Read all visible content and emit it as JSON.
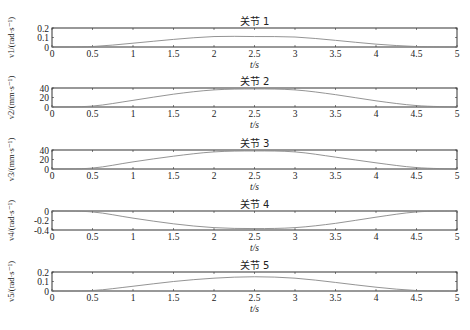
{
  "chart_data": [
    {
      "type": "line",
      "title": "关节 1",
      "xlabel": "t/s",
      "ylabel": "v1/(rad·s⁻¹)",
      "xlim": [
        0,
        5
      ],
      "ylim": [
        0,
        0.2
      ],
      "xticks": [
        "0",
        "0.5",
        "1",
        "1.5",
        "2",
        "2.5",
        "3",
        "3.5",
        "4",
        "4.5",
        "5"
      ],
      "yticks": [
        "0",
        "0.1",
        "0.2"
      ],
      "x": [
        0,
        0.5,
        1,
        1.5,
        2,
        2.5,
        3,
        3.5,
        4,
        4.5,
        5
      ],
      "values": [
        0,
        0.005,
        0.04,
        0.08,
        0.11,
        0.11,
        0.105,
        0.07,
        0.03,
        0.005,
        0
      ]
    },
    {
      "type": "line",
      "title": "关节 2",
      "xlabel": "t/s",
      "ylabel": "v2/(mm·s⁻¹)",
      "xlim": [
        0,
        5
      ],
      "ylim": [
        0,
        40
      ],
      "xticks": [
        "0",
        "0.5",
        "1",
        "1.5",
        "2",
        "2.5",
        "3",
        "3.5",
        "4",
        "4.5",
        "5"
      ],
      "yticks": [
        "0",
        "20",
        "40"
      ],
      "x": [
        0,
        0.5,
        1,
        1.5,
        2,
        2.5,
        3,
        3.5,
        4,
        4.5,
        5
      ],
      "values": [
        0,
        2,
        14,
        27,
        36,
        38,
        36,
        26,
        13,
        3,
        0
      ]
    },
    {
      "type": "line",
      "title": "关节 3",
      "xlabel": "t/s",
      "ylabel": "v3/(mm·s⁻¹)",
      "xlim": [
        0,
        5
      ],
      "ylim": [
        0,
        40
      ],
      "xticks": [
        "0",
        "0.5",
        "1",
        "1.5",
        "2",
        "2.5",
        "3",
        "3.5",
        "4",
        "4.5",
        "5"
      ],
      "yticks": [
        "0",
        "20",
        "40"
      ],
      "x": [
        0,
        0.5,
        1,
        1.5,
        2,
        2.5,
        3,
        3.5,
        4,
        4.5,
        5
      ],
      "values": [
        0,
        2,
        15,
        27,
        36,
        38,
        36,
        25,
        13,
        3,
        0
      ]
    },
    {
      "type": "line",
      "title": "关节 4",
      "xlabel": "t/s",
      "ylabel": "v4/(rad·s⁻¹)",
      "xlim": [
        0,
        5
      ],
      "ylim": [
        -0.4,
        0
      ],
      "xticks": [
        "0",
        "0.5",
        "1",
        "1.5",
        "2",
        "2.5",
        "3",
        "3.5",
        "4",
        "4.5",
        "5"
      ],
      "yticks": [
        "-0.4",
        "-0.2",
        "0"
      ],
      "x": [
        0,
        0.5,
        1,
        1.5,
        2,
        2.5,
        3,
        3.5,
        4,
        4.5,
        5
      ],
      "values": [
        0,
        -0.02,
        -0.15,
        -0.27,
        -0.35,
        -0.37,
        -0.35,
        -0.26,
        -0.13,
        -0.02,
        0
      ]
    },
    {
      "type": "line",
      "title": "关节 5",
      "xlabel": "t/s",
      "ylabel": "v5/(rad·s⁻¹)",
      "xlim": [
        0,
        5
      ],
      "ylim": [
        0,
        0.2
      ],
      "xticks": [
        "0",
        "0.5",
        "1",
        "1.5",
        "2",
        "2.5",
        "3",
        "3.5",
        "4",
        "4.5",
        "5"
      ],
      "yticks": [
        "0",
        "0.1",
        "0.2"
      ],
      "x": [
        0,
        0.5,
        1,
        1.5,
        2,
        2.5,
        3,
        3.5,
        4,
        4.5,
        5
      ],
      "values": [
        0,
        0.005,
        0.05,
        0.1,
        0.135,
        0.15,
        0.135,
        0.09,
        0.04,
        0.005,
        0
      ]
    }
  ],
  "colors": {
    "axes": "#333333",
    "line": "#888888"
  }
}
